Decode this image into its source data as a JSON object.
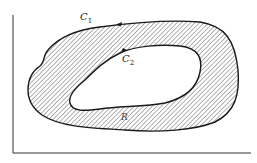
{
  "diagram": {
    "type": "region-between-curves",
    "labels": {
      "outer_curve": "C",
      "outer_curve_sub": "1",
      "inner_curve": "C",
      "inner_curve_sub": "2",
      "region": "R"
    },
    "colors": {
      "stroke": "#1a1a1a",
      "hatch": "#555555",
      "background": "#ffffff"
    },
    "axes": {
      "x_axis": true,
      "y_axis": true
    }
  }
}
